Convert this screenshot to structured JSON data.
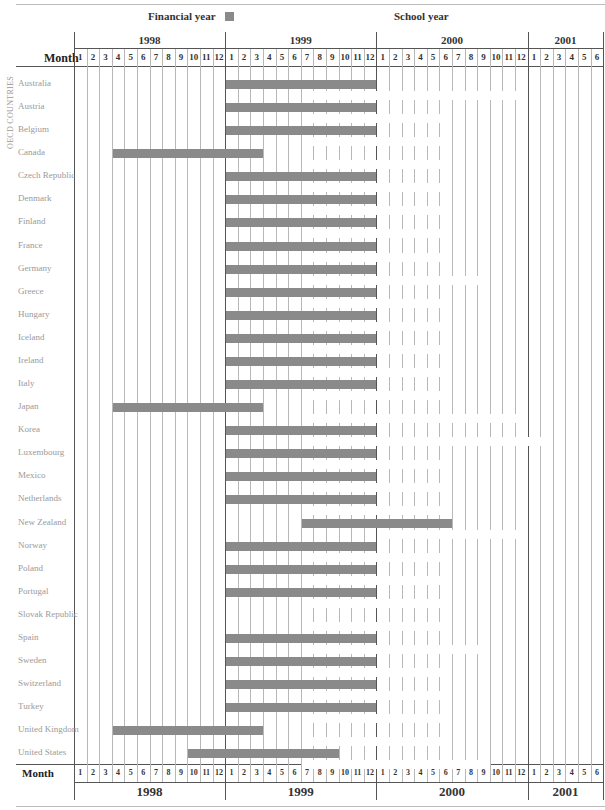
{
  "chart_data": {
    "type": "gantt",
    "title": "",
    "legend": [
      {
        "label": "Financial year",
        "color": "#8a8a8a"
      },
      {
        "label": "School year",
        "color": "#ffffff"
      }
    ],
    "x_axis": {
      "label": "Month",
      "years": [
        "1998",
        "1999",
        "2000",
        "2001"
      ],
      "months_per_year": [
        12,
        12,
        12,
        6
      ],
      "range": [
        "1998-01",
        "2001-06"
      ]
    },
    "y_axis": {
      "label": "OECD COUNTRIES"
    },
    "rows": [
      {
        "country": "Australia",
        "financial_year": [
          "1999-01",
          "1999-12"
        ],
        "school_year": [
          "1999-07",
          "2000-12"
        ]
      },
      {
        "country": "Austria",
        "financial_year": [
          "1999-01",
          "1999-12"
        ],
        "school_year": [
          "1999-07",
          "2000-06"
        ]
      },
      {
        "country": "Belgium",
        "financial_year": [
          "1999-01",
          "1999-12"
        ],
        "school_year": [
          "1999-07",
          "2000-06"
        ]
      },
      {
        "country": "Canada",
        "financial_year": [
          "1998-04",
          "1999-03"
        ],
        "school_year": [
          "1999-07",
          "2000-06"
        ]
      },
      {
        "country": "Czech Republic",
        "financial_year": [
          "1999-01",
          "1999-12"
        ],
        "school_year": [
          "1999-07",
          "2000-06"
        ]
      },
      {
        "country": "Denmark",
        "financial_year": [
          "1999-01",
          "1999-12"
        ],
        "school_year": [
          "1999-07",
          "2000-06"
        ]
      },
      {
        "country": "Finland",
        "financial_year": [
          "1999-01",
          "1999-12"
        ],
        "school_year": [
          "1999-07",
          "2000-06"
        ]
      },
      {
        "country": "France",
        "financial_year": [
          "1999-01",
          "1999-12"
        ],
        "school_year": [
          "1999-07",
          "2000-06"
        ]
      },
      {
        "country": "Germany",
        "financial_year": [
          "1999-01",
          "1999-12"
        ],
        "school_year": [
          "1999-07",
          "2000-09"
        ]
      },
      {
        "country": "Greece",
        "financial_year": [
          "1999-01",
          "1999-12"
        ],
        "school_year": [
          "1999-07",
          "2000-06"
        ]
      },
      {
        "country": "Hungary",
        "financial_year": [
          "1999-01",
          "1999-12"
        ],
        "school_year": [
          "1999-07",
          "2000-06"
        ]
      },
      {
        "country": "Iceland",
        "financial_year": [
          "1999-01",
          "1999-12"
        ],
        "school_year": [
          "1999-07",
          "2000-06"
        ]
      },
      {
        "country": "Ireland",
        "financial_year": [
          "1999-01",
          "1999-12"
        ],
        "school_year": [
          "1999-07",
          "2000-06"
        ]
      },
      {
        "country": "Italy",
        "financial_year": [
          "1999-01",
          "1999-12"
        ],
        "school_year": [
          "1999-07",
          "2000-06"
        ]
      },
      {
        "country": "Japan",
        "financial_year": [
          "1998-04",
          "1999-03"
        ],
        "school_year": [
          "1999-07",
          "2000-12"
        ]
      },
      {
        "country": "Korea",
        "financial_year": [
          "1999-01",
          "1999-12"
        ],
        "school_year": [
          "1999-07",
          "2001-02"
        ]
      },
      {
        "country": "Luxembourg",
        "financial_year": [
          "1999-01",
          "1999-12"
        ],
        "school_year": [
          "1999-07",
          "2000-06"
        ]
      },
      {
        "country": "Mexico",
        "financial_year": [
          "1999-01",
          "1999-12"
        ],
        "school_year": [
          "1999-07",
          "2000-06"
        ]
      },
      {
        "country": "Netherlands",
        "financial_year": [
          "1999-01",
          "1999-12"
        ],
        "school_year": [
          "1999-07",
          "2000-06"
        ]
      },
      {
        "country": "New Zealand",
        "financial_year": [
          "1999-07",
          "2000-06"
        ],
        "school_year": [
          "2000-01",
          "2000-12"
        ]
      },
      {
        "country": "Norway",
        "financial_year": [
          "1999-01",
          "1999-12"
        ],
        "school_year": [
          "1999-07",
          "2000-06"
        ]
      },
      {
        "country": "Poland",
        "financial_year": [
          "1999-01",
          "1999-12"
        ],
        "school_year": [
          "1999-07",
          "2000-06"
        ]
      },
      {
        "country": "Portugal",
        "financial_year": [
          "1999-01",
          "1999-12"
        ],
        "school_year": [
          "1999-07",
          "2000-06"
        ]
      },
      {
        "country": "Slovak Republic",
        "financial_year": null,
        "school_year": [
          "1999-07",
          "2000-06"
        ]
      },
      {
        "country": "Spain",
        "financial_year": [
          "1999-01",
          "1999-12"
        ],
        "school_year": [
          "1999-07",
          "2000-09"
        ]
      },
      {
        "country": "Sweden",
        "financial_year": [
          "1999-01",
          "1999-12"
        ],
        "school_year": [
          "1999-07",
          "2000-06"
        ]
      },
      {
        "country": "Switzerland",
        "financial_year": [
          "1999-01",
          "1999-12"
        ],
        "school_year": [
          "1999-07",
          "2000-06"
        ]
      },
      {
        "country": "Turkey",
        "financial_year": [
          "1999-01",
          "1999-12"
        ],
        "school_year": [
          "1999-07",
          "2000-06"
        ]
      },
      {
        "country": "United Kingdom",
        "financial_year": [
          "1998-04",
          "1999-03"
        ],
        "school_year": [
          "1999-07",
          "2000-06"
        ]
      },
      {
        "country": "United States",
        "financial_year": [
          "1998-10",
          "1999-09"
        ],
        "school_year": [
          "1999-07",
          "2000-09"
        ]
      }
    ]
  },
  "legend": {
    "financial_label": "Financial year",
    "school_label": "School year"
  },
  "header": {
    "month_label": "Month",
    "years": [
      "1998",
      "1999",
      "2000",
      "2001"
    ]
  },
  "footer": {
    "month_label": "Month",
    "years": [
      "1998",
      "1999",
      "2000",
      "2001"
    ]
  },
  "y_axis_label": "OECD COUNTRIES",
  "colors": {
    "financial_bar": "#8a8a8a",
    "school_bar": "#ffffff",
    "grid": "#b8b8b8"
  }
}
